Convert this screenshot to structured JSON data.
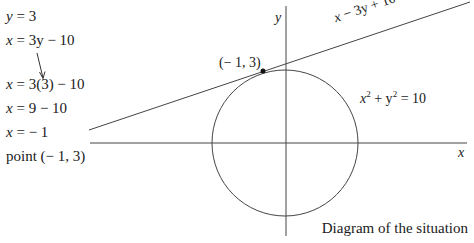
{
  "working": {
    "steps": [
      {
        "lhs": "y",
        "rhs": " = 3"
      },
      {
        "lhs": "x",
        "rhs": " = 3y − 10"
      },
      {
        "lhs": "x",
        "rhs": " = 3(3) − 10"
      },
      {
        "lhs": "x",
        "rhs": " = 9 − 10"
      },
      {
        "lhs": "x",
        "rhs": " = − 1"
      }
    ],
    "conclusion": "point (− 1, 3)"
  },
  "diagram": {
    "x_axis_label": "x",
    "y_axis_label": "y",
    "line_label": "x − 3y + 10 = 0",
    "circle_label_x": "x",
    "circle_label_exp": "2",
    "circle_label_mid": " + y",
    "circle_label_exp2": "2",
    "circle_label_rhs": " = 10",
    "point_label": "(− 1, 3)",
    "caption": "Diagram of the situation",
    "stroke_color": "#333333"
  }
}
